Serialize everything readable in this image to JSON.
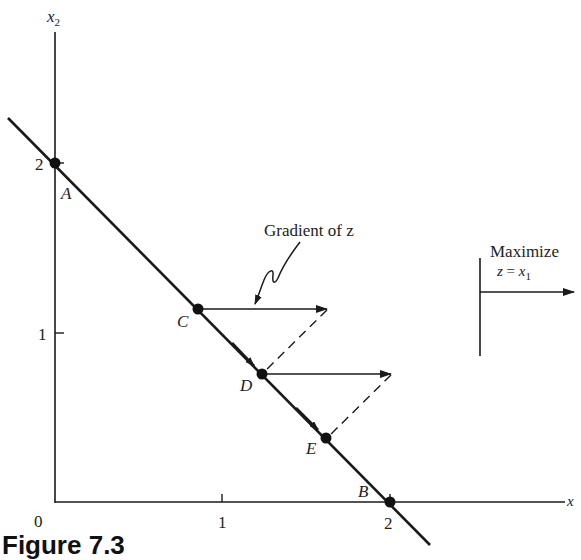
{
  "figure": {
    "caption": "Figure 7.3",
    "axes": {
      "x_label": "x",
      "y_label_base": "x",
      "y_label_sub": "2",
      "origin_label": "0",
      "x_ticks": [
        "1",
        "2"
      ],
      "y_ticks": [
        "1",
        "2"
      ]
    },
    "points": [
      {
        "name": "A",
        "x": 0,
        "y": 2
      },
      {
        "name": "B",
        "x": 2,
        "y": 0
      },
      {
        "name": "C",
        "x": 0.85,
        "y": 1.15
      },
      {
        "name": "D",
        "x": 1.23,
        "y": 0.77
      },
      {
        "name": "E",
        "x": 1.61,
        "y": 0.39
      }
    ],
    "annotation": {
      "gradient_label": "Gradient of z"
    },
    "objective_box": {
      "title": "Maximize",
      "formula_lhs": "z",
      "formula_eq": " = ",
      "formula_var": "x",
      "formula_sub": "1"
    },
    "colors": {
      "ink": "#1a1a1a",
      "background": "#ffffff"
    }
  }
}
